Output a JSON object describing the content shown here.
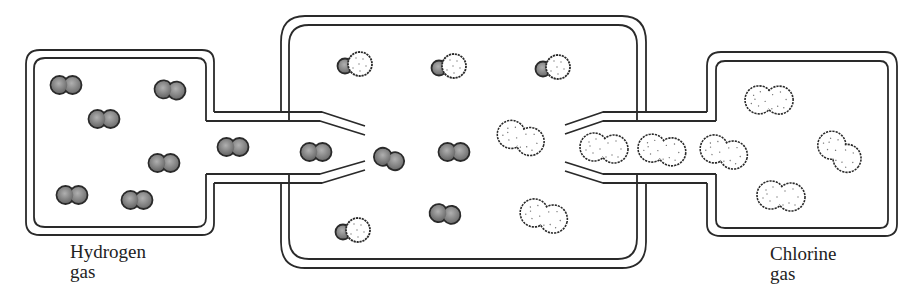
{
  "diagram": {
    "labels": {
      "hydrogen_line1": "Hydrogen",
      "hydrogen_line2": "gas",
      "chlorine_line1": "Chlorine",
      "chlorine_line2": "gas"
    },
    "colors": {
      "line": "#2a2a2a",
      "hydrogen_fill": "#8a8a8a",
      "chlorine_fill": "#ffffff",
      "background": "#ffffff"
    },
    "containers": [
      {
        "name": "hydrogen-chamber",
        "side": "left"
      },
      {
        "name": "reaction-chamber",
        "side": "center"
      },
      {
        "name": "chlorine-chamber",
        "side": "right"
      }
    ],
    "molecules": {
      "hydrogen_H2": [
        {
          "x": 66,
          "y": 85,
          "angle": 0
        },
        {
          "x": 170,
          "y": 90,
          "angle": 5
        },
        {
          "x": 104,
          "y": 119,
          "angle": 0
        },
        {
          "x": 164,
          "y": 163,
          "angle": 0
        },
        {
          "x": 72,
          "y": 195,
          "angle": 0
        },
        {
          "x": 137,
          "y": 200,
          "angle": 0
        },
        {
          "x": 233,
          "y": 147,
          "angle": 0
        },
        {
          "x": 316,
          "y": 152,
          "angle": 0
        },
        {
          "x": 389,
          "y": 159,
          "angle": 20
        },
        {
          "x": 454,
          "y": 152,
          "angle": 0
        },
        {
          "x": 445,
          "y": 214,
          "angle": 8
        }
      ],
      "hydrogen_chloride_HCl": [
        {
          "x": 344,
          "y": 64
        },
        {
          "x": 442,
          "y": 66
        },
        {
          "x": 547,
          "y": 67
        },
        {
          "x": 345,
          "y": 230
        }
      ],
      "chlorine_Cl2": [
        {
          "x": 520,
          "y": 138,
          "angle": 15
        },
        {
          "x": 543,
          "y": 216,
          "angle": 12
        },
        {
          "x": 604,
          "y": 147,
          "angle": 0
        },
        {
          "x": 662,
          "y": 149,
          "angle": 5
        },
        {
          "x": 724,
          "y": 152,
          "angle": 10
        },
        {
          "x": 769,
          "y": 100,
          "angle": -5
        },
        {
          "x": 840,
          "y": 152,
          "angle": 35
        },
        {
          "x": 781,
          "y": 195,
          "angle": 0
        }
      ]
    }
  }
}
